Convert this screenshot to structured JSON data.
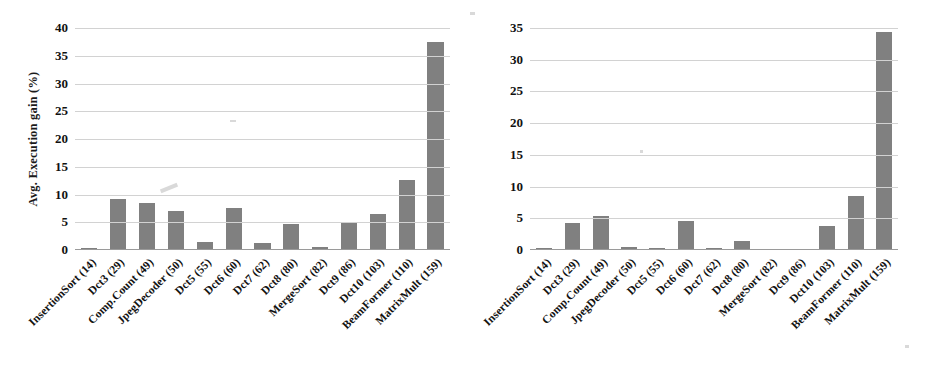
{
  "chart_data": [
    {
      "type": "bar",
      "title": "",
      "xlabel": "",
      "ylabel": "Avg. Execution gain (%)",
      "ylim": [
        0,
        40
      ],
      "yticks": [
        0,
        5,
        10,
        15,
        20,
        25,
        30,
        35,
        40
      ],
      "ytick_labels": [
        "0",
        "5",
        "10",
        "15",
        "20",
        "25",
        "30",
        "35",
        "40"
      ],
      "grid": true,
      "legend": "none",
      "bar_color": "#808080",
      "categories": [
        "InsertionSort (14)",
        "Dct3 (29)",
        "Comp.Count (49)",
        "JpegDecoder (50)",
        "Dct5 (55)",
        "Dct6 (60)",
        "Dct7 (62)",
        "Dct8 (80)",
        "MergeSort (82)",
        "Dct9 (86)",
        "Dct10 (103)",
        "BeamFormer (110)",
        "MatrixMult (159)"
      ],
      "values": [
        0.4,
        9.2,
        8.5,
        7.0,
        1.5,
        7.6,
        1.3,
        4.6,
        0.6,
        5.0,
        6.5,
        12.7,
        37.4
      ]
    },
    {
      "type": "bar",
      "title": "",
      "xlabel": "",
      "ylabel": "Avg. Latency gain (%)",
      "ylim": [
        0,
        35
      ],
      "yticks": [
        0,
        5,
        10,
        15,
        20,
        25,
        30,
        35
      ],
      "ytick_labels": [
        "0",
        "5",
        "10",
        "15",
        "20",
        "25",
        "30",
        "35"
      ],
      "grid": true,
      "legend": "none",
      "bar_color": "#808080",
      "categories": [
        "InsertionSort (14)",
        "Dct3 (29)",
        "Comp.Count (49)",
        "JpegDecoder (50)",
        "Dct5 (55)",
        "Dct6 (60)",
        "Dct7 (62)",
        "Dct8 (80)",
        "MergeSort (82)",
        "Dct9 (86)",
        "Dct10 (103)",
        "BeamFormer (110)",
        "MatrixMult (159)"
      ],
      "values": [
        0.15,
        4.2,
        5.3,
        0.4,
        0.3,
        4.6,
        0.15,
        1.5,
        0.0,
        0.0,
        3.8,
        8.5,
        34.3
      ]
    }
  ]
}
